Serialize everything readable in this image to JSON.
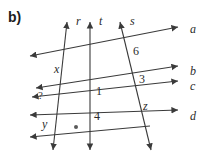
{
  "figure": {
    "part_label": "b)",
    "type": "geometry-diagram"
  },
  "colors": {
    "line": "#3a3a3a",
    "text": "#2b2b2b",
    "background": "#ffffff",
    "part_label": "#1c1c1c"
  },
  "transversals": [
    {
      "name": "r",
      "label": "r",
      "label_x": 76,
      "label_y": 15,
      "x_top": 67,
      "y_top": 22,
      "x_bottom": 53,
      "y_bottom": 150
    },
    {
      "name": "t",
      "label": "t",
      "label_x": 99,
      "label_y": 15,
      "x_top": 90,
      "y_top": 22,
      "x_bottom": 90,
      "y_bottom": 150
    },
    {
      "name": "s",
      "label": "s",
      "label_x": 130,
      "label_y": 15,
      "x_top": 120,
      "y_top": 22,
      "x_bottom": 151,
      "y_bottom": 150
    }
  ],
  "parallel_lines": [
    {
      "name": "a",
      "label": "a",
      "label_x": 190,
      "label_y": 23,
      "x_left": 30,
      "y_left": 56,
      "x_right": 178,
      "y_right": 27
    },
    {
      "name": "b",
      "label": "b",
      "label_x": 190,
      "label_y": 65,
      "x_left": 36,
      "y_left": 88,
      "x_right": 178,
      "y_right": 66
    },
    {
      "name": "c",
      "label": "c",
      "label_x": 190,
      "label_y": 80,
      "x_left": 32,
      "y_left": 97,
      "x_right": 178,
      "y_right": 81
    },
    {
      "name": "d",
      "label": "d",
      "label_x": 190,
      "label_y": 110,
      "x_left": 30,
      "y_left": 115,
      "x_right": 178,
      "y_right": 110
    },
    {
      "name": "e",
      "label": "",
      "label_x": 0,
      "label_y": 0,
      "x_left": 30,
      "y_left": 137,
      "x_right": 150,
      "y_right": 126
    }
  ],
  "angle_labels": [
    {
      "name": "x",
      "text": "x",
      "x": 54,
      "y": 63,
      "style": "italic"
    },
    {
      "name": "6",
      "text": "6",
      "x": 133,
      "y": 45,
      "style": "normal"
    },
    {
      "name": "3",
      "text": "3",
      "x": 139,
      "y": 73,
      "style": "normal"
    },
    {
      "name": "1",
      "text": "1",
      "x": 96,
      "y": 85,
      "style": "normal"
    },
    {
      "name": "z",
      "text": "z",
      "x": 143,
      "y": 100,
      "style": "italic"
    },
    {
      "name": "4",
      "text": "4",
      "x": 94,
      "y": 110,
      "style": "normal"
    },
    {
      "name": "y",
      "text": "y",
      "x": 42,
      "y": 118,
      "style": "italic"
    },
    {
      "name": "question",
      "text": "?",
      "x": 38,
      "y": 90,
      "style": "normal"
    }
  ],
  "tick_marker": {
    "name": "dot-marker",
    "x": 76,
    "y": 127
  }
}
